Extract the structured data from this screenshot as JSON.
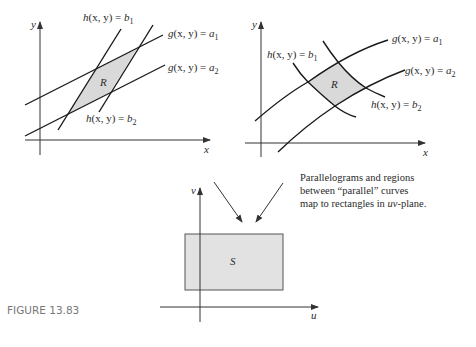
{
  "figure_label": "FIGURE 13.83",
  "caption": {
    "line1": "Parallelograms and regions",
    "line2": "between “parallel” curves",
    "line3_pre": "map to rectangles in ",
    "line3_it": "uv",
    "line3_post": "-plane."
  },
  "left_panel": {
    "x_axis": "x",
    "y_axis": "y",
    "region": "R",
    "labels": {
      "h_b1": {
        "fn": "h",
        "args": "(x, y) = ",
        "var": "b",
        "sub": "1"
      },
      "h_b2": {
        "fn": "h",
        "args": "(x, y) = ",
        "var": "b",
        "sub": "2"
      },
      "g_a1": {
        "fn": "g",
        "args": "(x, y) = ",
        "var": "a",
        "sub": "1"
      },
      "g_a2": {
        "fn": "g",
        "args": "(x, y) = ",
        "var": "a",
        "sub": "2"
      }
    }
  },
  "right_panel": {
    "x_axis": "x",
    "y_axis": "y",
    "region": "R",
    "labels": {
      "h_b1": {
        "fn": "h",
        "args": "(x, y) = ",
        "var": "b",
        "sub": "1"
      },
      "h_b2": {
        "fn": "h",
        "args": "(x, y) = ",
        "var": "b",
        "sub": "2"
      },
      "g_a1": {
        "fn": "g",
        "args": "(x, y) = ",
        "var": "a",
        "sub": "1"
      },
      "g_a2": {
        "fn": "g",
        "args": "(x, y) = ",
        "var": "a",
        "sub": "2"
      }
    }
  },
  "bottom_panel": {
    "x_axis": "u",
    "y_axis": "v",
    "region": "S"
  },
  "colors": {
    "region_fill": "#d9d9d9",
    "line": "#1a1a1a"
  }
}
